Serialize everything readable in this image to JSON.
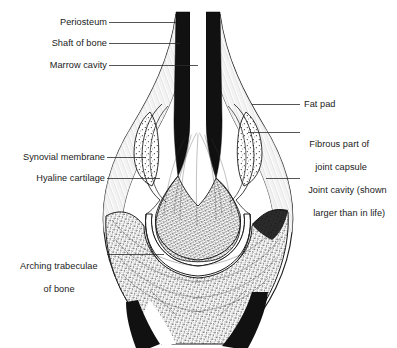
{
  "figure": {
    "background_color": "#ffffff",
    "ink_color": "#1a1a1a",
    "labels": {
      "periosteum": "Periosteum",
      "shaft_of_bone": "Shaft of bone",
      "marrow_cavity": "Marrow cavity",
      "synovial_membrane": "Synovial membrane",
      "hyaline_cartilage": "Hyaline cartilage",
      "arching_trabeculae_line1": "Arching trabeculae",
      "arching_trabeculae_line2": "of bone",
      "fat_pad": "Fat pad",
      "fibrous_capsule_line1": "Fibrous part of",
      "fibrous_capsule_line2": "joint capsule",
      "joint_cavity_line1": "Joint cavity (shown",
      "joint_cavity_line2": "larger than in life)"
    }
  }
}
